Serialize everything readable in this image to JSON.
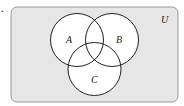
{
  "item_marker": ".",
  "diagram": {
    "type": "venn",
    "universe": {
      "label": "U",
      "x": 11,
      "y": 7,
      "width": 167,
      "height": 95,
      "corner_radius": 6,
      "fill": "#e6e6e6",
      "stroke": "#9a9a9a"
    },
    "sets": [
      {
        "label": "A",
        "cx": 77,
        "cy": 40,
        "r": 26.5,
        "label_x": 68,
        "label_y": 42
      },
      {
        "label": "B",
        "cx": 112,
        "cy": 40,
        "r": 26.5,
        "label_x": 118,
        "label_y": 42
      },
      {
        "label": "C",
        "cx": 94.5,
        "cy": 69,
        "r": 26.5,
        "label_x": 91,
        "label_y": 83
      }
    ],
    "circle_fill": "#ffffff",
    "circle_stroke": "#222222"
  }
}
